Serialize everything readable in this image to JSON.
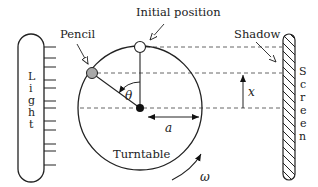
{
  "diagram": {
    "labels": {
      "pencil": "Pencil",
      "initial_position": "Initial position",
      "shadow": "Shadow",
      "turntable": "Turntable",
      "theta": "θ",
      "a": "a",
      "x": "x",
      "omega": "ω"
    },
    "light_letters": [
      "L",
      "i",
      "g",
      "h",
      "t"
    ],
    "screen_letters": [
      "S",
      "c",
      "r",
      "e",
      "e",
      "n"
    ],
    "geometry": {
      "turntable_center": [
        140,
        108
      ],
      "turntable_radius": 62,
      "pencil_pos": [
        92,
        73
      ],
      "initial_pos": [
        140,
        47
      ]
    },
    "colors": {
      "stroke": "#222222",
      "pencil_fill": "#a8a8a8",
      "initial_fill": "#ffffff",
      "center_fill": "#111111",
      "dash": "#555555"
    }
  }
}
